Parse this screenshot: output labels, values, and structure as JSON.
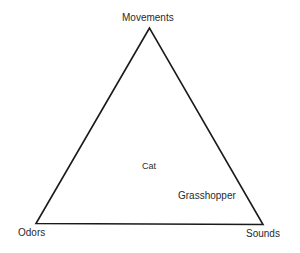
{
  "diagram": {
    "type": "triangle",
    "vertices": {
      "top": {
        "label": "Movements"
      },
      "bottom_left": {
        "label": "Odors"
      },
      "bottom_right": {
        "label": "Sounds"
      }
    },
    "points": [
      {
        "label": "Cat"
      },
      {
        "label": "Grasshopper"
      }
    ],
    "colors": {
      "line": "#1a1a1a",
      "text": "#2a2a2a",
      "background": "#ffffff"
    }
  }
}
